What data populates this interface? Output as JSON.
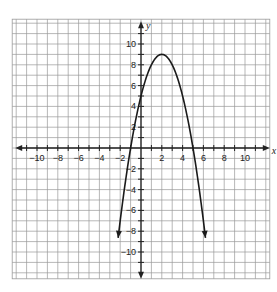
{
  "chart_data": {
    "type": "line",
    "title": "",
    "xlabel": "x",
    "ylabel": "y",
    "xlim": [
      -12,
      12
    ],
    "ylim": [
      -12,
      12
    ],
    "grid": true,
    "x_ticks": [
      -10,
      -8,
      -6,
      -4,
      -2,
      2,
      4,
      6,
      8,
      10
    ],
    "y_ticks": [
      10,
      8,
      6,
      4,
      2,
      -2,
      -4,
      -6,
      -8,
      -10
    ],
    "x_tick_labels": [
      "−10",
      "−8",
      "−6",
      "−4",
      "−2",
      "2",
      "4",
      "6",
      "8",
      "10"
    ],
    "y_tick_labels": [
      "10",
      "8",
      "6",
      "4",
      "2",
      "−2",
      "−4",
      "−6",
      "−8",
      "−10"
    ],
    "series": [
      {
        "name": "parabola",
        "equation": "y = -(x - 2)^2 + 9",
        "vertex": [
          2,
          9
        ],
        "x_intercepts": [
          -1,
          5
        ],
        "y_intercept": 5,
        "x_range": [
          -2.2,
          6.2
        ],
        "arrows": "both ends pointing down",
        "color": "#1a1a1a"
      }
    ]
  },
  "style": {
    "grid_color": "#9a9a9a",
    "axis_color": "#222222",
    "curve_color": "#1a1a1a",
    "background": "#ffffff"
  }
}
